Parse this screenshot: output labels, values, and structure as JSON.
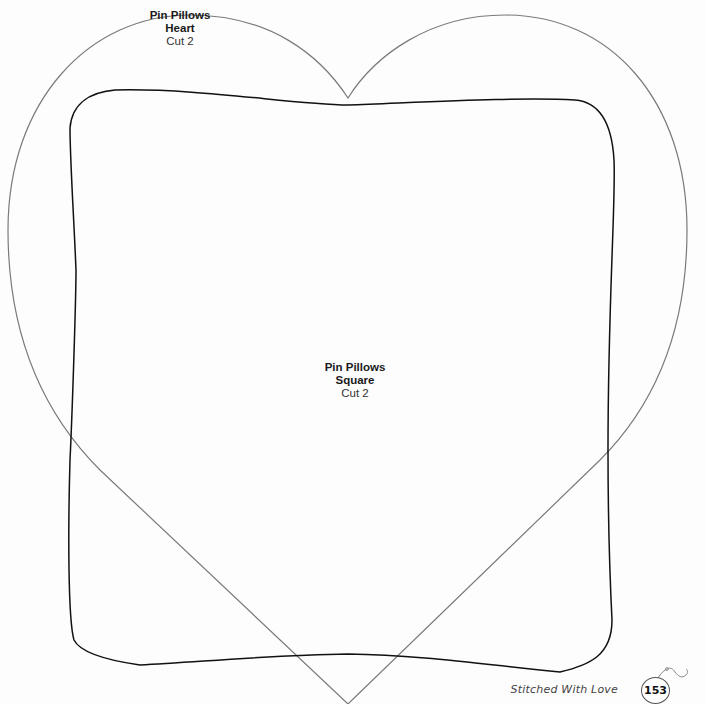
{
  "patterns": [
    {
      "id": "heart",
      "title_lines": [
        "Pin Pillows",
        "Heart"
      ],
      "instruction": "Cut 2",
      "stroke_color": "#7a7a7a"
    },
    {
      "id": "square",
      "title_lines": [
        "Pin Pillows",
        "Square"
      ],
      "instruction": "Cut 2",
      "stroke_color": "#111111"
    }
  ],
  "footer": {
    "book_title": "Stitched With Love",
    "page_number": "153",
    "icon": "ornament-hook-icon"
  }
}
